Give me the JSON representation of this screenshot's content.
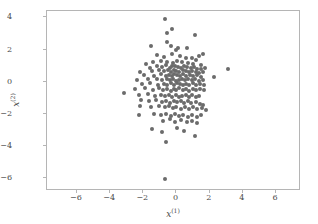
{
  "chart_data": {
    "type": "scatter",
    "title": "",
    "xlabel": "x^(1)",
    "ylabel": "x^(2)",
    "xlabel_base": "x",
    "xlabel_sup": "(1)",
    "ylabel_base": "x",
    "ylabel_sup": "(2)",
    "xlim": [
      -7.8,
      7.5
    ],
    "ylim": [
      -6.8,
      4.4
    ],
    "xticks": [
      -6,
      -4,
      -2,
      0,
      2,
      4,
      6
    ],
    "yticks": [
      -6,
      -4,
      -2,
      0,
      2,
      4
    ],
    "xticklabels": [
      "-6",
      "-4",
      "-2",
      "0",
      "2",
      "4",
      "6"
    ],
    "yticklabels": [
      "-6",
      "-4",
      "-2",
      "0",
      "2",
      "4"
    ],
    "grid": false,
    "legend": null,
    "marker": "circle",
    "marker_color": "#6b6b6b",
    "marker_size": 4,
    "n_points": 200,
    "axes_color": "#b5b5b5",
    "background_color": "#ffffff",
    "points": [
      [
        -0.72,
        3.88
      ],
      [
        -0.25,
        3.3
      ],
      [
        -0.55,
        3.06
      ],
      [
        1.1,
        2.88
      ],
      [
        -1.55,
        2.2
      ],
      [
        -0.6,
        2.45
      ],
      [
        -0.35,
        2.22
      ],
      [
        0.1,
        2.12
      ],
      [
        0.62,
        2.1
      ],
      [
        -0.05,
        1.98
      ],
      [
        1.62,
        1.75
      ],
      [
        1.35,
        1.62
      ],
      [
        -1.15,
        1.68
      ],
      [
        -0.78,
        1.55
      ],
      [
        -0.3,
        1.72
      ],
      [
        0.2,
        1.62
      ],
      [
        0.55,
        1.5
      ],
      [
        0.95,
        1.45
      ],
      [
        1.18,
        1.35
      ],
      [
        -1.85,
        1.12
      ],
      [
        -1.42,
        1.2
      ],
      [
        -0.95,
        1.3
      ],
      [
        -0.55,
        1.25
      ],
      [
        -0.2,
        1.18
      ],
      [
        0.05,
        1.28
      ],
      [
        0.35,
        1.22
      ],
      [
        0.7,
        1.15
      ],
      [
        1.02,
        1.1
      ],
      [
        1.48,
        1.05
      ],
      [
        -1.62,
        0.88
      ],
      [
        -1.2,
        0.95
      ],
      [
        -0.88,
        0.92
      ],
      [
        -0.62,
        1.02
      ],
      [
        -0.42,
        0.88
      ],
      [
        -0.25,
        0.95
      ],
      [
        -0.08,
        1.0
      ],
      [
        0.12,
        0.92
      ],
      [
        0.3,
        0.88
      ],
      [
        0.48,
        0.95
      ],
      [
        0.65,
        0.9
      ],
      [
        0.85,
        0.85
      ],
      [
        1.05,
        0.92
      ],
      [
        1.25,
        0.82
      ],
      [
        1.45,
        0.78
      ],
      [
        1.72,
        0.85
      ],
      [
        3.12,
        0.78
      ],
      [
        -2.18,
        0.62
      ],
      [
        -1.5,
        0.68
      ],
      [
        -1.05,
        0.72
      ],
      [
        -0.75,
        0.65
      ],
      [
        -0.52,
        0.7
      ],
      [
        -0.35,
        0.62
      ],
      [
        -0.18,
        0.75
      ],
      [
        0.0,
        0.68
      ],
      [
        0.18,
        0.6
      ],
      [
        0.38,
        0.72
      ],
      [
        0.55,
        0.65
      ],
      [
        0.75,
        0.58
      ],
      [
        0.95,
        0.68
      ],
      [
        1.15,
        0.62
      ],
      [
        1.38,
        0.55
      ],
      [
        1.6,
        0.62
      ],
      [
        -1.95,
        0.42
      ],
      [
        -1.35,
        0.38
      ],
      [
        -0.92,
        0.45
      ],
      [
        -0.65,
        0.35
      ],
      [
        -0.45,
        0.42
      ],
      [
        -0.28,
        0.38
      ],
      [
        -0.12,
        0.48
      ],
      [
        0.05,
        0.4
      ],
      [
        0.22,
        0.35
      ],
      [
        0.42,
        0.45
      ],
      [
        0.6,
        0.38
      ],
      [
        0.82,
        0.42
      ],
      [
        1.0,
        0.35
      ],
      [
        1.22,
        0.4
      ],
      [
        1.5,
        0.32
      ],
      [
        -2.35,
        0.12
      ],
      [
        -1.72,
        0.18
      ],
      [
        -1.18,
        0.15
      ],
      [
        -0.85,
        0.08
      ],
      [
        -0.58,
        0.18
      ],
      [
        -0.38,
        0.1
      ],
      [
        -0.2,
        0.15
      ],
      [
        -0.02,
        0.05
      ],
      [
        0.15,
        0.12
      ],
      [
        0.35,
        0.18
      ],
      [
        0.52,
        0.08
      ],
      [
        0.72,
        0.15
      ],
      [
        0.92,
        0.1
      ],
      [
        1.12,
        0.18
      ],
      [
        1.35,
        0.05
      ],
      [
        1.58,
        0.12
      ],
      [
        2.25,
        0.3
      ],
      [
        -2.05,
        -0.15
      ],
      [
        -1.58,
        -0.08
      ],
      [
        -1.12,
        -0.18
      ],
      [
        -0.78,
        -0.12
      ],
      [
        -0.55,
        -0.2
      ],
      [
        -0.32,
        -0.1
      ],
      [
        -0.15,
        -0.18
      ],
      [
        0.02,
        -0.08
      ],
      [
        0.2,
        -0.15
      ],
      [
        0.4,
        -0.22
      ],
      [
        0.58,
        -0.12
      ],
      [
        0.78,
        -0.18
      ],
      [
        0.98,
        -0.1
      ],
      [
        1.18,
        -0.2
      ],
      [
        1.42,
        -0.15
      ],
      [
        1.68,
        -0.22
      ],
      [
        -3.18,
        -0.72
      ],
      [
        -2.48,
        -0.48
      ],
      [
        -1.88,
        -0.42
      ],
      [
        -1.42,
        -0.5
      ],
      [
        -1.08,
        -0.42
      ],
      [
        -0.8,
        -0.52
      ],
      [
        -0.55,
        -0.45
      ],
      [
        -0.35,
        -0.55
      ],
      [
        -0.18,
        -0.45
      ],
      [
        0.0,
        -0.52
      ],
      [
        0.18,
        -0.42
      ],
      [
        0.38,
        -0.5
      ],
      [
        0.58,
        -0.45
      ],
      [
        0.78,
        -0.55
      ],
      [
        0.98,
        -0.48
      ],
      [
        1.2,
        -0.52
      ],
      [
        1.42,
        -0.45
      ],
      [
        1.65,
        -0.5
      ],
      [
        -2.28,
        -0.85
      ],
      [
        -1.72,
        -0.78
      ],
      [
        -1.28,
        -0.88
      ],
      [
        -0.92,
        -0.8
      ],
      [
        -0.68,
        -0.9
      ],
      [
        -0.45,
        -0.82
      ],
      [
        -0.25,
        -0.92
      ],
      [
        -0.05,
        -0.85
      ],
      [
        0.15,
        -0.95
      ],
      [
        0.35,
        -0.88
      ],
      [
        0.55,
        -0.8
      ],
      [
        0.75,
        -0.92
      ],
      [
        0.95,
        -0.85
      ],
      [
        1.15,
        -0.95
      ],
      [
        1.38,
        -0.88
      ],
      [
        -2.15,
        -1.15
      ],
      [
        -1.65,
        -1.22
      ],
      [
        -1.25,
        -1.12
      ],
      [
        -0.88,
        -1.25
      ],
      [
        -0.62,
        -1.18
      ],
      [
        -0.38,
        -1.3
      ],
      [
        -0.15,
        -1.2
      ],
      [
        0.05,
        -1.28
      ],
      [
        0.28,
        -1.18
      ],
      [
        0.48,
        -1.32
      ],
      [
        0.68,
        -1.22
      ],
      [
        0.9,
        -1.35
      ],
      [
        1.15,
        -1.25
      ],
      [
        1.4,
        -1.38
      ],
      [
        1.62,
        -1.45
      ],
      [
        -2.22,
        -1.48
      ],
      [
        -1.52,
        -1.55
      ],
      [
        -1.05,
        -1.48
      ],
      [
        -0.72,
        -1.6
      ],
      [
        -0.45,
        -1.52
      ],
      [
        -0.22,
        -1.65
      ],
      [
        0.0,
        -1.55
      ],
      [
        0.25,
        -1.68
      ],
      [
        0.5,
        -1.58
      ],
      [
        0.75,
        -1.7
      ],
      [
        1.0,
        -1.6
      ],
      [
        1.25,
        -1.72
      ],
      [
        1.52,
        -1.62
      ],
      [
        1.75,
        -1.75
      ],
      [
        -2.28,
        -2.05
      ],
      [
        -1.38,
        -1.98
      ],
      [
        -0.95,
        -2.08
      ],
      [
        -0.62,
        -2.0
      ],
      [
        -0.35,
        -2.12
      ],
      [
        -0.1,
        -2.02
      ],
      [
        0.15,
        -2.15
      ],
      [
        0.42,
        -2.05
      ],
      [
        0.68,
        -2.18
      ],
      [
        0.95,
        -2.08
      ],
      [
        1.22,
        -2.2
      ],
      [
        1.48,
        -2.1
      ],
      [
        -0.82,
        -2.42
      ],
      [
        -0.42,
        -2.35
      ],
      [
        -0.08,
        -2.48
      ],
      [
        0.28,
        -2.38
      ],
      [
        0.62,
        -2.5
      ],
      [
        0.95,
        -2.42
      ],
      [
        1.25,
        -2.55
      ],
      [
        -1.45,
        -2.95
      ],
      [
        -0.88,
        -3.1
      ],
      [
        0.05,
        -2.88
      ],
      [
        0.45,
        -3.05
      ],
      [
        1.12,
        -3.38
      ],
      [
        -0.62,
        -3.75
      ],
      [
        -0.72,
        -6.08
      ]
    ]
  }
}
